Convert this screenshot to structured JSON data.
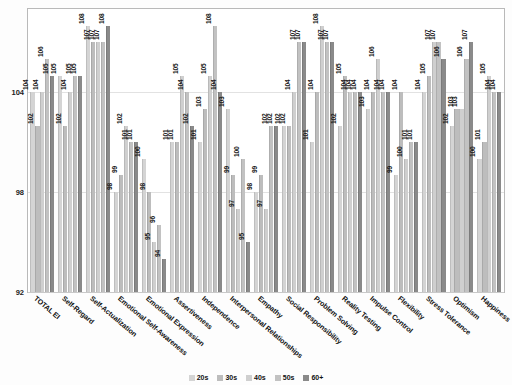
{
  "chart_data": {
    "type": "bar",
    "title": "",
    "subtitle": "",
    "xlabel": "",
    "ylabel": "",
    "ylim": [
      92,
      109
    ],
    "yticks": [
      92,
      98,
      104
    ],
    "grid": true,
    "legend_position": "bottom",
    "categories": [
      "TOTAL EI",
      "Self-Regard",
      "Self-Actualization",
      "Emotional Self-Awareness",
      "Emotional Expression",
      "Assertiveness",
      "Independence",
      "Interpersonal Relationships",
      "Empathy",
      "Social Responsibility",
      "Problem Solving",
      "Reality Testing",
      "Impulse Control",
      "Flexibility",
      "Stress Tolerance",
      "Optimism",
      "Happiness"
    ],
    "series": [
      {
        "name": "20s",
        "color": "#d4d4d4",
        "values": [
          104,
          105,
          108,
          98,
          100,
          101,
          101,
          103,
          98,
          102,
          101,
          102,
          103,
          99,
          104,
          102,
          100
        ]
      },
      {
        "name": "30s",
        "color": "#bdbdbd",
        "values": [
          102,
          102,
          107,
          99,
          98,
          101,
          103,
          99,
          99,
          102,
          104,
          105,
          104,
          104,
          105,
          103,
          101
        ]
      },
      {
        "name": "40s",
        "color": "#cfcfcf",
        "values": [
          104,
          104,
          107,
          102,
          95,
          105,
          105,
          97,
          97,
          104,
          108,
          104,
          106,
          100,
          107,
          103,
          105
        ]
      },
      {
        "name": "50s",
        "color": "#c2c2c2",
        "values": [
          106,
          105,
          107,
          101,
          96,
          104,
          108,
          100,
          102,
          107,
          107,
          104,
          104,
          101,
          107,
          106,
          104
        ]
      },
      {
        "name": "60+",
        "color": "#8a8a8a",
        "values": [
          105,
          105,
          108,
          101,
          94,
          102,
          104,
          95,
          102,
          107,
          107,
          104,
          104,
          101,
          106,
          107,
          104
        ]
      }
    ]
  },
  "legend": {
    "items": [
      {
        "label": "20s",
        "color": "#d4d4d4"
      },
      {
        "label": "30s",
        "color": "#bdbdbd"
      },
      {
        "label": "40s",
        "color": "#cfcfcf"
      },
      {
        "label": "50s",
        "color": "#c2c2c2"
      },
      {
        "label": "60+",
        "color": "#8a8a8a"
      }
    ]
  }
}
